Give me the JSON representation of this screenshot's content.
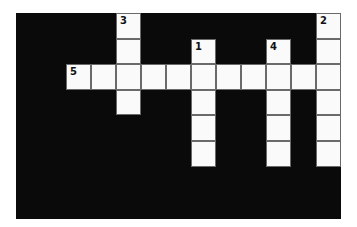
{
  "puzzle": {
    "type": "crossword",
    "grid": {
      "cols": 13,
      "rows": 8,
      "cell_size": 25,
      "colors": {
        "block": "#0a0a0a",
        "cell": "#fafafa",
        "border": "#6a6a6a"
      }
    },
    "cells": [
      {
        "row": 0,
        "col": 4,
        "number": "3"
      },
      {
        "row": 0,
        "col": 12,
        "number": "2"
      },
      {
        "row": 1,
        "col": 4,
        "number": ""
      },
      {
        "row": 1,
        "col": 7,
        "number": "1"
      },
      {
        "row": 1,
        "col": 10,
        "number": "4"
      },
      {
        "row": 1,
        "col": 12,
        "number": ""
      },
      {
        "row": 2,
        "col": 2,
        "number": "5"
      },
      {
        "row": 2,
        "col": 3,
        "number": ""
      },
      {
        "row": 2,
        "col": 4,
        "number": ""
      },
      {
        "row": 2,
        "col": 5,
        "number": ""
      },
      {
        "row": 2,
        "col": 6,
        "number": ""
      },
      {
        "row": 2,
        "col": 7,
        "number": ""
      },
      {
        "row": 2,
        "col": 8,
        "number": ""
      },
      {
        "row": 2,
        "col": 9,
        "number": ""
      },
      {
        "row": 2,
        "col": 10,
        "number": ""
      },
      {
        "row": 2,
        "col": 11,
        "number": ""
      },
      {
        "row": 2,
        "col": 12,
        "number": ""
      },
      {
        "row": 3,
        "col": 4,
        "number": ""
      },
      {
        "row": 3,
        "col": 7,
        "number": ""
      },
      {
        "row": 3,
        "col": 10,
        "number": ""
      },
      {
        "row": 3,
        "col": 12,
        "number": ""
      },
      {
        "row": 4,
        "col": 7,
        "number": ""
      },
      {
        "row": 4,
        "col": 10,
        "number": ""
      },
      {
        "row": 4,
        "col": 12,
        "number": ""
      },
      {
        "row": 5,
        "col": 7,
        "number": ""
      },
      {
        "row": 5,
        "col": 10,
        "number": ""
      },
      {
        "row": 5,
        "col": 12,
        "number": ""
      }
    ],
    "entries": {
      "across": [
        {
          "number": "5",
          "row": 2,
          "col": 2,
          "length": 11
        }
      ],
      "down": [
        {
          "number": "1",
          "row": 1,
          "col": 7,
          "length": 5
        },
        {
          "number": "2",
          "row": 0,
          "col": 12,
          "length": 6
        },
        {
          "number": "3",
          "row": 0,
          "col": 4,
          "length": 4
        },
        {
          "number": "4",
          "row": 1,
          "col": 10,
          "length": 5
        }
      ]
    }
  }
}
